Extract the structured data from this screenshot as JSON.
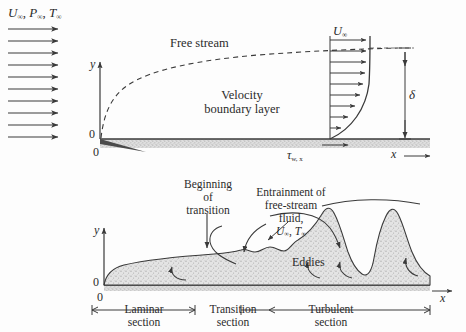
{
  "figure": {
    "background_color": "#fdfdfd",
    "ink_color": "#2b2b2b",
    "wall_fill": "#d9d9d9",
    "boundary_fill": "#e2e2e2"
  },
  "top_panel": {
    "freestream_label": {
      "u": "U",
      "u_sub": "∞",
      "p": "P",
      "p_sub": "∞",
      "t": "T",
      "t_sub": "∞",
      "sep1": ", ",
      "sep2": ", "
    },
    "freestream_arrow_count": 10,
    "free_stream_text": "Free stream",
    "boundary_layer_text_line1": "Velocity",
    "boundary_layer_text_line2": "boundary layer",
    "y_axis_label": "y",
    "origin_label_upper": "0",
    "origin_label_lower": "0",
    "x_axis_label": "x",
    "x_axis_arrow": "⟶",
    "profile_velocity_label": {
      "symbol": "U",
      "sub": "∞"
    },
    "profile_arrow_count": 9,
    "delta_label": "δ",
    "wall_shear_label": {
      "symbol": "τ",
      "sub": "w, x"
    }
  },
  "bottom_panel": {
    "y_axis_label": "y",
    "origin_label_upper": "0",
    "origin_label_lower": "0",
    "x_axis_label": "x",
    "x_axis_arrow": "⟶",
    "beginning_of_transition": {
      "line1": "Beginning",
      "line2": "of",
      "line3": "transition"
    },
    "entrainment": {
      "line1": "Entrainment of",
      "line2": "free-stream",
      "line3": "fluid,",
      "u": "U",
      "u_sub": "∞",
      "t": "T",
      "t_sub": "∞",
      "sep": ", "
    },
    "eddies_label": "Eddies",
    "sections": [
      {
        "name": "laminar",
        "line1": "Laminar",
        "line2": "section"
      },
      {
        "name": "transition",
        "line1": "Transition",
        "line2": "section"
      },
      {
        "name": "turbulent",
        "line1": "Turbulent",
        "line2": "section"
      }
    ]
  }
}
